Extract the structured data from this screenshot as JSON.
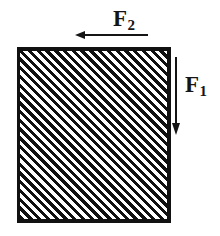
{
  "figure": {
    "name": "free-body-diagram-hatched-block",
    "background_color": "#ffffff",
    "ink_color": "#111111",
    "block": {
      "shape": "square",
      "fill": "diagonal-hatch",
      "hatch_angle_deg": 45,
      "hatch_period_px": 6,
      "border_color": "#111111",
      "x": 17,
      "y": 47,
      "width": 154,
      "height": 176
    },
    "forces": [
      {
        "id": "f2",
        "label_main": "F",
        "label_sub": "2",
        "label_text": "F2",
        "direction": "left",
        "position": "above-block",
        "arrow": {
          "x1": 150,
          "y1": 35,
          "x2": 76,
          "y2": 35
        },
        "label_x": 113,
        "label_y": 7
      },
      {
        "id": "f1",
        "label_main": "F",
        "label_sub": "1",
        "label_text": "F1",
        "direction": "down",
        "position": "right-of-block",
        "arrow": {
          "x1": 176,
          "y1": 57,
          "x2": 176,
          "y2": 133
        },
        "label_x": 185,
        "label_y": 73
      }
    ]
  }
}
